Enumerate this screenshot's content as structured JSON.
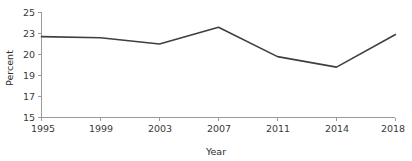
{
  "chart_data": {
    "type": "line",
    "title": "",
    "subtitle": "",
    "xlabel": "Year",
    "ylabel": "Percent",
    "categories": [
      "1995",
      "1999",
      "2003",
      "2007",
      "2011",
      "2014",
      "2018"
    ],
    "x": [
      1995,
      1999,
      2003,
      2007,
      2011,
      2014,
      2018
    ],
    "values": [
      22.7,
      22.6,
      22.0,
      23.6,
      20.8,
      19.8,
      22.9
    ],
    "series": [
      {
        "name": "Percent",
        "values": [
          22.7,
          22.6,
          22.0,
          23.6,
          20.8,
          19.8,
          22.9
        ],
        "color": "#3f3f3f"
      }
    ],
    "y_tick_labels": [
      "15",
      "17",
      "19",
      "20",
      "23",
      "25"
    ],
    "x_tick_labels": [
      "1995",
      "1999",
      "2003",
      "2007",
      "2011",
      "2014",
      "2018"
    ],
    "ylim": [
      15,
      25
    ],
    "grid": false,
    "legend": false,
    "legend_position": "none",
    "line_color": "#3f3f3f",
    "axis_color": "#9a9a9a",
    "background_color": "#ffffff"
  },
  "axes": {
    "y_title": "Percent",
    "x_title": "Year"
  }
}
